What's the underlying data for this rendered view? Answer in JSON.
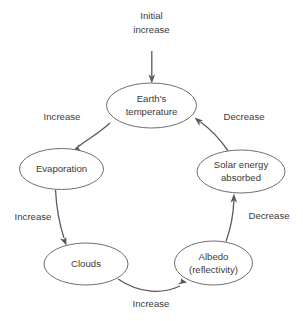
{
  "diagram": {
    "type": "cycle-flowchart",
    "background_color": "#ffffff",
    "node_fill_color": "#ffffff",
    "node_stroke_color": "#6f6f6f",
    "arrow_color": "#5a5a5a",
    "text_color": "#3b3b3b",
    "input": {
      "label_lines": [
        "Initial",
        "increase"
      ],
      "target": "earths-temperature"
    },
    "nodes": [
      {
        "id": "earths-temperature",
        "label_lines": [
          "Earth's",
          "temperature"
        ],
        "cx": 151.5,
        "cy": 105.5,
        "rx": 45,
        "ry": 22.5
      },
      {
        "id": "evaporation",
        "label_lines": [
          "Evaporation"
        ],
        "cx": 61.5,
        "cy": 169,
        "rx": 42,
        "ry": 20.5
      },
      {
        "id": "solar-energy-absorbed",
        "label_lines": [
          "Solar energy",
          "absorbed"
        ],
        "cx": 241,
        "cy": 171.5,
        "rx": 44,
        "ry": 21.5
      },
      {
        "id": "clouds",
        "label_lines": [
          "Clouds"
        ],
        "cx": 86,
        "cy": 264,
        "rx": 42,
        "ry": 21
      },
      {
        "id": "albedo-reflectivity",
        "label_lines": [
          "Albedo",
          "(reflectivity)"
        ],
        "cx": 213.5,
        "cy": 263,
        "rx": 39,
        "ry": 22
      }
    ],
    "edges": [
      {
        "id": "temperature-to-evaporation",
        "from": "earths-temperature",
        "to": "evaporation",
        "label": "Increase"
      },
      {
        "id": "evaporation-to-clouds",
        "from": "evaporation",
        "to": "clouds",
        "label": "Increase"
      },
      {
        "id": "clouds-to-albedo",
        "from": "clouds",
        "to": "albedo-reflectivity",
        "label": "Increase"
      },
      {
        "id": "albedo-to-solar",
        "from": "albedo-reflectivity",
        "to": "solar-energy-absorbed",
        "label": "Decrease"
      },
      {
        "id": "solar-to-temperature",
        "from": "solar-energy-absorbed",
        "to": "earths-temperature",
        "label": "Decrease"
      }
    ]
  }
}
